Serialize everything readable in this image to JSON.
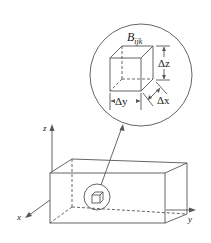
{
  "diagram": {
    "detail_label": "B",
    "detail_subscript": "ijk",
    "dimension_labels": {
      "dz": "Δz",
      "dy": "Δy",
      "dx": "Δx"
    },
    "axes": {
      "z": "z",
      "x": "x",
      "y": "y"
    },
    "colors": {
      "line": "#555555",
      "background": "#ffffff"
    }
  }
}
